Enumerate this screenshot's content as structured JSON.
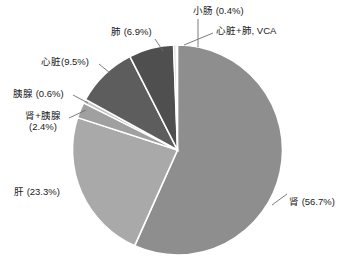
{
  "chart_data": {
    "type": "pie",
    "title": "",
    "subtitle": "",
    "xlabel": "",
    "ylabel": "",
    "legend_position": "none",
    "grid": false,
    "label_format": "name (percent%)",
    "categories": [
      "肾",
      "肝",
      "心脏",
      "肺",
      "肾+胰腺",
      "胰腺",
      "小肠",
      "心脏+肺, VCA"
    ],
    "values": [
      56.7,
      23.3,
      9.5,
      6.9,
      2.4,
      0.6,
      0.4,
      0.2
    ],
    "units": "%",
    "start_angle_deg": -90,
    "direction": "clockwise",
    "slices": [
      {
        "id": "shen",
        "name": "肾",
        "percent": 56.7,
        "label": "肾 (56.7%)",
        "color": "#8e8e8e",
        "start_deg": -88.0,
        "end_deg": 116.1
      },
      {
        "id": "gan",
        "name": "肝",
        "percent": 23.3,
        "label": "肝 (23.3%)",
        "color": "#a9a9a9",
        "start_deg": 116.1,
        "end_deg": 200.0
      },
      {
        "id": "shen-yixian",
        "name": "肾+胰腺",
        "percent": 2.4,
        "label": "肾+胰腺 (2.4%)",
        "color": "#a0a0a0",
        "start_deg": 200.0,
        "end_deg": 208.6
      },
      {
        "id": "yixian",
        "name": "胰腺",
        "percent": 0.6,
        "label": "胰腺 (0.6%)",
        "color": "#c4c4c4",
        "start_deg": 208.6,
        "end_deg": 210.8
      },
      {
        "id": "xinzang",
        "name": "心脏",
        "percent": 9.5,
        "label": "心脏(9.5%)",
        "color": "#5d5d5d",
        "start_deg": 210.8,
        "end_deg": 245.0
      },
      {
        "id": "fei",
        "name": "肺",
        "percent": 6.9,
        "label": "肺 (6.9%)",
        "color": "#4f4f4f",
        "start_deg": 245.0,
        "end_deg": 269.8
      },
      {
        "id": "xiaochang",
        "name": "小肠",
        "percent": 0.4,
        "label": "小肠 (0.4%)",
        "color": "#d8d8d8",
        "start_deg": 269.8,
        "end_deg": 271.2
      },
      {
        "id": "xinzang-fei-vca",
        "name": "心脏+肺, VCA",
        "percent": 0.2,
        "label": "心脏+肺, VCA",
        "color": "#bdbdbd",
        "start_deg": 271.2,
        "end_deg": 272.0
      }
    ]
  },
  "labels": {
    "xiaochang": "小肠 (0.4%)",
    "xinzang_fei_vca": "心脏+肺, VCA",
    "fei": "肺 (6.9%)",
    "xinzang": "心脏(9.5%)",
    "yixian": "胰腺 (0.6%)",
    "shen_yixian_line1": "肾+胰腺",
    "shen_yixian_line2": "(2.4%)",
    "gan": "肝 (23.3%)",
    "shen": "肾 (56.7%)"
  },
  "colors": {
    "background": "#ffffff",
    "slice_border": "#ffffff",
    "leader_line": "#6e6e6e",
    "text": "#1b1b1b"
  }
}
